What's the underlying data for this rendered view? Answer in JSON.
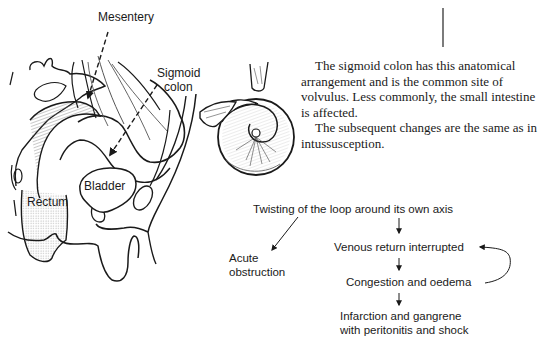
{
  "anatomy": {
    "labels": {
      "mesentery": "Mesentery",
      "sigmoid_colon": [
        "Sigmoid",
        "colon"
      ],
      "bladder": "Bladder",
      "rectum": "Rectum"
    }
  },
  "description": {
    "paragraphs": [
      "The sigmoid colon has this anatomical arrangement and is the common site of volvulus. Less commonly, the small intestine is affected.",
      "The subsequent changes are the same as in intussusception."
    ]
  },
  "flowchart": {
    "root": "Twisting of the loop around its own axis",
    "branch_left": [
      "Acute",
      "obstruction"
    ],
    "steps": [
      "Venous return interrupted",
      "Congestion and oedema",
      "Infarction and gangrene",
      "with peritonitis and shock"
    ],
    "feedback_loop": "Congestion and oedema → Venous return interrupted"
  },
  "colors": {
    "ink": "#1a1a1a",
    "shading": "#9a9a9a",
    "background": "#ffffff"
  }
}
